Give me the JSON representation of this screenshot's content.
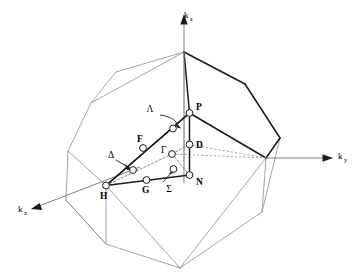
{
  "figure": {
    "kind": "brillouin-zone-diagram",
    "background_color": "#ffffff",
    "line_color_front": "#1a1a1a",
    "line_color_back": "#8d8d8d",
    "node_fill_color": "#ffffff"
  },
  "axes": [
    {
      "id": "kz",
      "symbol": "k",
      "subscript": "z",
      "label": "k_z",
      "direction": "up",
      "label_x": 184,
      "label_y": 18,
      "sub_dx": 6.0,
      "sub_dy": 3.0
    },
    {
      "id": "ky",
      "symbol": "k",
      "subscript": "y",
      "label": "k_y",
      "direction": "right",
      "label_x": 338,
      "label_y": 159,
      "sub_dx": 6.0,
      "sub_dy": 3.0
    },
    {
      "id": "kx",
      "symbol": "k",
      "subscript": "x",
      "label": "k_x",
      "direction": "lower-left",
      "label_x": 18,
      "label_y": 212,
      "sub_dx": 6.0,
      "sub_dy": 3.0
    }
  ],
  "points": [
    {
      "id": "P",
      "label": "P",
      "style": "bold",
      "x": 189.5,
      "y": 113.0,
      "label_x": 196,
      "label_y": 110
    },
    {
      "id": "D",
      "label": "D",
      "style": "bold",
      "x": 189.5,
      "y": 144.5,
      "label_x": 196,
      "label_y": 147
    },
    {
      "id": "N",
      "label": "N",
      "style": "bold",
      "x": 189.5,
      "y": 175.0,
      "label_x": 196,
      "label_y": 184
    },
    {
      "id": "F",
      "label": "F",
      "style": "bold",
      "x": 143.0,
      "y": 148.0,
      "label_x": 138,
      "label_y": 141
    },
    {
      "id": "G",
      "label": "G",
      "style": "bold",
      "x": 146.5,
      "y": 180.0,
      "label_x": 142,
      "label_y": 192
    },
    {
      "id": "H",
      "label": "H",
      "style": "bold",
      "x": 106.0,
      "y": 185.5,
      "label_x": 101,
      "label_y": 198
    },
    {
      "id": "Gamma",
      "label": "Γ",
      "style": "greek",
      "x": 172.0,
      "y": 154.0,
      "label_x": 162,
      "label_y": 152
    },
    {
      "id": "Lambda-node",
      "label": "",
      "style": "plain",
      "x": 173.0,
      "y": 128.5,
      "label_x": 0,
      "label_y": 0
    },
    {
      "id": "Delta-node",
      "label": "",
      "style": "plain",
      "x": 133.0,
      "y": 170.0,
      "label_x": 0,
      "label_y": 0
    },
    {
      "id": "Sigma-node",
      "label": "",
      "style": "plain",
      "x": 173.5,
      "y": 169.0,
      "label_x": 0,
      "label_y": 0
    }
  ],
  "symmetry_lines": [
    {
      "id": "Lambda",
      "label": "Λ",
      "label_x": 150,
      "label_y": 112,
      "description": "Gamma to P"
    },
    {
      "id": "Delta",
      "label": "Δ",
      "label_x": 111,
      "label_y": 158,
      "description": "Gamma to H"
    },
    {
      "id": "Sigma",
      "label": "Σ",
      "label_x": 169,
      "label_y": 192,
      "description": "Gamma to N"
    },
    {
      "id": "D",
      "label": "D",
      "label_x": 196,
      "label_y": 147,
      "description": "P to N"
    },
    {
      "id": "F",
      "label": "F",
      "label_x": 138,
      "label_y": 141,
      "description": "P to H"
    },
    {
      "id": "G",
      "label": "G",
      "label_x": 142,
      "label_y": 192,
      "description": "H to N"
    }
  ],
  "geometry": {
    "bz_back_edges": [
      "M 184 52 L 91 103 L 68 151 L 106 185.5",
      "M 68 151 L 66 200 L 106 244",
      "M 106 185.5 L 106 244",
      "M 106 244 L 180 268",
      "M 180 268 L 262 212",
      "M 262 212 L 266 158",
      "M 91 103 L 116 72",
      "M 116 72 L 184 52",
      "M 106 185.5 L 180 268",
      "M 180 268 L 266 158"
    ],
    "bz_front_edges": [
      "M 184 52 L 245 84 L 280 138 L 266 158",
      "M 266 158 L 189.5 113 L 184 52",
      "M 189.5 113 L 266 158"
    ],
    "wedge_solid": [
      "M 106 185.5 L 189.5 113",
      "M 189.5 113 L 189.5 175",
      "M 189.5 175 L 106 185.5",
      "M 106 185.5 L 172 154",
      "M 172 154 L 189.5 113"
    ],
    "wedge_dash": [
      "M 172 154 L 106 185.5",
      "M 172 154 L 189.5 175",
      "M 172 154 L 189.5 144.5"
    ],
    "guides": [
      "M 184 52 L 184 155",
      "M 172 154 L 266 158",
      "M 189.5 144.5 L 266 158"
    ]
  }
}
